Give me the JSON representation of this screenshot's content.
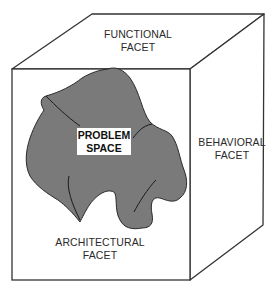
{
  "diagram": {
    "type": "cube-facets",
    "facets": {
      "top": {
        "line1": "FUNCTIONAL",
        "line2": "FACET"
      },
      "right": {
        "line1": "BEHAVIORAL",
        "line2": "FACET"
      },
      "front": {
        "line1": "ARCHITECTURAL",
        "line2": "FACET"
      }
    },
    "center": {
      "line1": "PROBLEM",
      "line2": "SPACE"
    },
    "colors": {
      "outline": "#333333",
      "blob_fill": "#7a7a7a",
      "background": "#ffffff",
      "label_box": "#ffffff"
    }
  }
}
